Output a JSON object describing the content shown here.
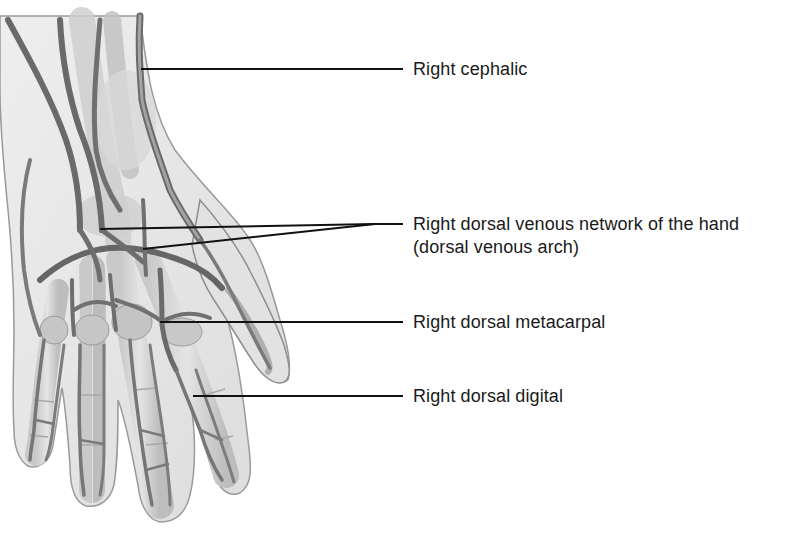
{
  "figure": {
    "illustration_style": "grayscale anatomical drawing",
    "colors": {
      "background": "#ffffff",
      "skin_fill": "#e6e6e6",
      "skin_outline": "#9a9a9a",
      "bone_fill": "#d2d2d2",
      "vein_fill": "#8c8c8c",
      "vein_dark": "#5e5e5e",
      "leader_line": "#111111",
      "label_text": "#1a1a1a"
    }
  },
  "labels": {
    "cephalic": "Right cephalic",
    "network_line1": "Right dorsal venous network of the hand",
    "network_line2": "(dorsal venous arch)",
    "metacarpal": "Right dorsal metacarpal",
    "digital": "Right dorsal digital"
  },
  "leader_lines": [
    {
      "id": "cephalic",
      "from": [
        141,
        69
      ],
      "to": [
        403,
        69
      ]
    },
    {
      "id": "network-a",
      "from": [
        100,
        229
      ],
      "to": [
        375,
        224
      ]
    },
    {
      "id": "network-b",
      "from": [
        143,
        249
      ],
      "to": [
        375,
        224
      ]
    },
    {
      "id": "network-stem",
      "from": [
        375,
        224
      ],
      "to": [
        403,
        224
      ]
    },
    {
      "id": "metacarpal",
      "from": [
        160,
        322
      ],
      "to": [
        403,
        322
      ]
    },
    {
      "id": "digital",
      "from": [
        193,
        396
      ],
      "to": [
        403,
        396
      ]
    }
  ]
}
